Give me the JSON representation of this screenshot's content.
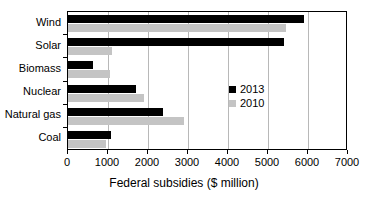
{
  "chart_data": {
    "type": "bar",
    "orientation": "horizontal",
    "title": "",
    "xlabel": "Federal subsidies ($ million)",
    "ylabel": "",
    "xlim": [
      0,
      7000
    ],
    "xticks": [
      0,
      1000,
      2000,
      3000,
      4000,
      5000,
      6000,
      7000
    ],
    "xtick_labels": [
      "0",
      "1000",
      "2000",
      "3000",
      "4000",
      "5000",
      "6000",
      "7000"
    ],
    "grid": "vertical",
    "legend_position": "inside-right",
    "categories": [
      "Wind",
      "Solar",
      "Biomass",
      "Nuclear",
      "Natural gas",
      "Coal"
    ],
    "series": [
      {
        "name": "2013",
        "color": "#000000",
        "values": [
          5900,
          5400,
          630,
          1700,
          2370,
          1070
        ]
      },
      {
        "name": "2010",
        "color": "#c4c4c4",
        "values": [
          5450,
          1100,
          1050,
          1900,
          2900,
          950
        ]
      }
    ]
  },
  "legend": {
    "items": [
      {
        "label": "2013",
        "color": "#000000"
      },
      {
        "label": "2010",
        "color": "#c4c4c4"
      }
    ]
  }
}
